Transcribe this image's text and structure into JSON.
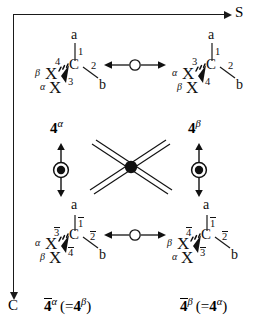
{
  "figure": {
    "type": "stereochemistry-scheme"
  },
  "axes": {
    "horizontal": {
      "label": "S",
      "direction": "right",
      "name": "s-axis"
    },
    "vertical": {
      "label": "C",
      "direction": "down",
      "name": "c-axis"
    }
  },
  "molecules": {
    "top_left": {
      "center": "C",
      "up_atom": "a",
      "up_label": "1",
      "right_atom": "b",
      "right_label": "2",
      "hash_atom": "X",
      "hash_prefix": "β",
      "hash_label": "4",
      "wedge_atom": "X",
      "wedge_prefix": "α",
      "wedge_label": "3"
    },
    "top_right": {
      "center": "C",
      "up_atom": "a",
      "up_label": "1",
      "right_atom": "b",
      "right_label": "2",
      "hash_atom": "X",
      "hash_prefix": "α",
      "hash_label": "3",
      "wedge_atom": "X",
      "wedge_prefix": "β",
      "wedge_label": "4"
    },
    "bottom_left": {
      "center": "C",
      "up_atom": "a",
      "up_label": "1",
      "up_label_overbar": true,
      "right_atom": "b",
      "right_label": "2",
      "right_label_overbar": true,
      "hash_atom": "X",
      "hash_prefix": "α",
      "hash_label": "3",
      "hash_label_overbar": true,
      "wedge_atom": "X",
      "wedge_prefix": "β",
      "wedge_label": "4",
      "wedge_label_overbar": true
    },
    "bottom_right": {
      "center": "C",
      "up_atom": "a",
      "up_label": "1",
      "up_label_overbar": true,
      "right_atom": "b",
      "right_label": "2",
      "right_label_overbar": true,
      "hash_atom": "X",
      "hash_prefix": "β",
      "hash_label": "4",
      "hash_label_overbar": true,
      "wedge_atom": "X",
      "wedge_prefix": "α",
      "wedge_label": "3",
      "wedge_label_overbar": true
    }
  },
  "names": {
    "top_left": {
      "numeral": "4",
      "overbar": false,
      "superscript": "α",
      "equiv": ""
    },
    "top_right": {
      "numeral": "4",
      "overbar": false,
      "superscript": "β",
      "equiv": ""
    },
    "bottom_left": {
      "numeral": "4",
      "overbar": true,
      "superscript": "α",
      "equiv_open": "(=",
      "equiv_numeral": "4",
      "equiv_sup": "β",
      "equiv_close": ")"
    },
    "bottom_right": {
      "numeral": "4",
      "overbar": true,
      "superscript": "β",
      "equiv_open": "(=",
      "equiv_numeral": "4",
      "equiv_sup": "α",
      "equiv_close": ")"
    }
  },
  "operators": {
    "horizontal_top": {
      "glyph": "double-headed-arrow-open-circle",
      "name": "s-operator-top"
    },
    "horizontal_bottom": {
      "glyph": "double-headed-arrow-open-circle",
      "name": "s-operator-bottom"
    },
    "vertical_left": {
      "glyph": "double-headed-arrow-filled-circle",
      "name": "c-operator-left"
    },
    "vertical_right": {
      "glyph": "double-headed-arrow-filled-circle",
      "name": "c-operator-right"
    },
    "diagonal_cross": {
      "glyph": "double-line-cross-filled-node",
      "name": "sc-operator-cross"
    }
  },
  "colors": {
    "ink": "#1a1a1a",
    "background": "#ffffff"
  }
}
